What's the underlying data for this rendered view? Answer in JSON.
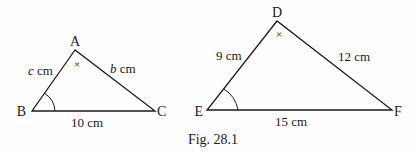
{
  "caption": "Fig. 28.1",
  "colors": {
    "stroke": "#1a1a1a",
    "background": "#fefefe"
  },
  "triangle_abc": {
    "vertices": {
      "A": "A",
      "B": "B",
      "C": "C"
    },
    "sides": {
      "AB": "c cm",
      "AB_var": "c",
      "AB_unit": " cm",
      "AC": "b cm",
      "AC_var": "b",
      "AC_unit": " cm",
      "BC": "10 cm"
    },
    "marks": {
      "angle_A": "×",
      "angle_B": "arc"
    }
  },
  "triangle_def": {
    "vertices": {
      "D": "D",
      "E": "E",
      "F": "F"
    },
    "sides": {
      "DE": "9 cm",
      "DF": "12 cm",
      "EF": "15 cm"
    },
    "marks": {
      "angle_D": "×",
      "angle_E": "arc"
    }
  }
}
